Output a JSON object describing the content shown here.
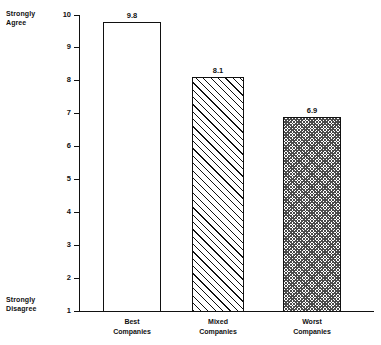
{
  "chart_data": {
    "type": "bar",
    "title": "",
    "subtitle": "",
    "xlabel": "",
    "ylabel": "",
    "categories": [
      "Best\nCompanies",
      "Mixed\nCompanies",
      "Worst\nCompanies"
    ],
    "values": [
      9.8,
      8.1,
      6.9
    ],
    "value_labels": [
      "9.8",
      "8.1",
      "6.9"
    ],
    "ylim": [
      1,
      10
    ],
    "y_ticks": [
      10,
      9,
      8,
      7,
      6,
      5,
      4,
      3,
      2,
      1
    ],
    "y_tick_labels": [
      "10",
      "9",
      "8",
      "7",
      "6",
      "5",
      "4",
      "3",
      "2",
      "1"
    ],
    "grid": false,
    "legend": "none",
    "scale_top_label": "Strongly\nAgree",
    "scale_bottom_label": "Strongly\nDisagree",
    "bar_fills": [
      "solid-white",
      "diagonal-hatch",
      "checkerboard"
    ],
    "colors": {
      "axis": "#111111",
      "bar_outline": "#111111",
      "text": "#111111",
      "background": "#ffffff",
      "hatch": "#111111",
      "checker": "#4a4a4a"
    }
  },
  "axis": {
    "top_label": "Strongly\nAgree",
    "bottom_label": "Strongly\nDisagree",
    "ticks": [
      {
        "label": "10",
        "value": 10
      },
      {
        "label": "9",
        "value": 9
      },
      {
        "label": "8",
        "value": 8
      },
      {
        "label": "7",
        "value": 7
      },
      {
        "label": "6",
        "value": 6
      },
      {
        "label": "5",
        "value": 5
      },
      {
        "label": "4",
        "value": 4
      },
      {
        "label": "3",
        "value": 3
      },
      {
        "label": "2",
        "value": 2
      },
      {
        "label": "1",
        "value": 1
      }
    ]
  },
  "bars": [
    {
      "category": "Best\nCompanies",
      "value_label": "9.8",
      "value": 9.8
    },
    {
      "category": "Mixed\nCompanies",
      "value_label": "8.1",
      "value": 8.1
    },
    {
      "category": "Worst\nCompanies",
      "value_label": "6.9",
      "value": 6.9
    }
  ]
}
